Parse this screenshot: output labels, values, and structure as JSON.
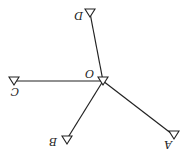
{
  "diagram": {
    "orientation": "rotated-180",
    "center": {
      "label": "O"
    },
    "nodes": [
      {
        "id": "O",
        "label": "O"
      },
      {
        "id": "A",
        "label": "A"
      },
      {
        "id": "B",
        "label": "B"
      },
      {
        "id": "C",
        "label": "C"
      },
      {
        "id": "D",
        "label": "D"
      }
    ],
    "edges": [
      {
        "from": "O",
        "to": "A"
      },
      {
        "from": "O",
        "to": "B"
      },
      {
        "from": "O",
        "to": "C"
      },
      {
        "from": "O",
        "to": "D"
      }
    ],
    "node_marker": "triangle-icon",
    "colors": {
      "stroke": "#222222",
      "background": "#ffffff"
    }
  }
}
